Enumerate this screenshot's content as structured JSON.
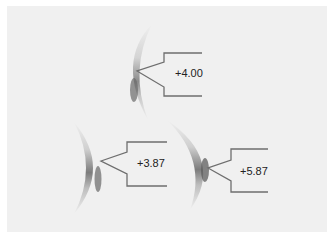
{
  "diagram": {
    "background_color": "#f0f0f0",
    "line_color": "#6e6e6e",
    "lenses": [
      {
        "id": "top",
        "power_label": "+4.00"
      },
      {
        "id": "bottom-left",
        "power_label": "+3.87"
      },
      {
        "id": "bottom-right",
        "power_label": "+5.87"
      }
    ]
  }
}
